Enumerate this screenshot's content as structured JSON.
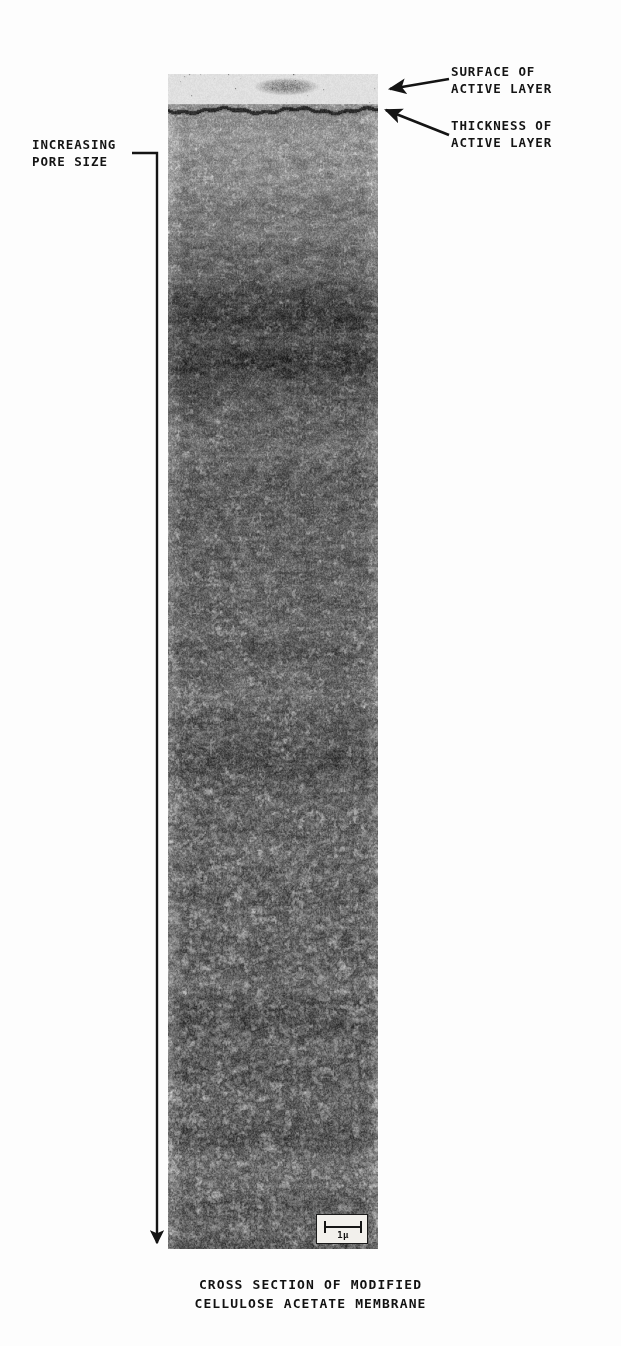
{
  "figure": {
    "type": "electron-micrograph",
    "caption": "CROSS SECTION OF MODIFIED\nCELLULOSE ACETATE MEMBRANE",
    "caption_line_1": "CROSS SECTION OF MODIFIED",
    "caption_line_2": "CELLULOSE ACETATE MEMBRANE",
    "background_color": "#fdfdfd",
    "ink_color": "#141414"
  },
  "annotations": {
    "surface_of_active_layer": {
      "line_1": "SURFACE OF",
      "line_2": "ACTIVE LAYER",
      "text": "SURFACE OF\nACTIVE LAYER",
      "pointer": "arrow-left"
    },
    "thickness_of_active_layer": {
      "line_1": "THICKNESS OF",
      "line_2": "ACTIVE LAYER",
      "text": "THICKNESS OF\nACTIVE LAYER",
      "pointer": "arrow-up-left"
    },
    "increasing_pore_size": {
      "line_1": "INCREASING",
      "line_2": "PORE SIZE",
      "text": "INCREASING\nPORE SIZE",
      "pointer": "bracket-down-arrow"
    }
  },
  "scale_bar": {
    "label": "1μ",
    "length_microns": 1,
    "position": "bottom-right-of-micrograph"
  },
  "micrograph": {
    "left_px": 168,
    "top_px": 74,
    "width_px": 210,
    "height_px": 1175,
    "description": "Asymmetric cellulose acetate membrane cross-section; dense dark active skin layer at top, porous substructure with pore size increasing downward."
  }
}
